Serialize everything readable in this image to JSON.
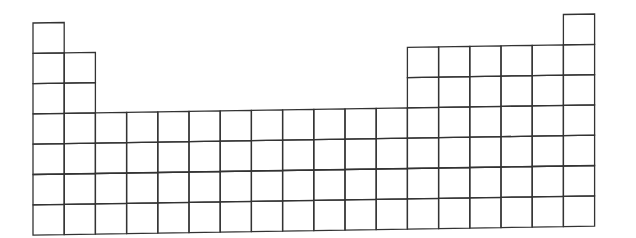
{
  "diagram": {
    "kind": "blank-periodic-table-outline",
    "columns": 18,
    "rows": 7,
    "line_color": "#333333",
    "background": "#ffffff",
    "grid": {
      "left_x": 33,
      "right_x": 595,
      "top_left_y": 23,
      "row_height": 30.3,
      "col_width": 31.2,
      "tilt_px_across": 9
    },
    "row_cells": [
      {
        "period": 1,
        "groups": [
          1,
          18
        ]
      },
      {
        "period": 2,
        "groups": [
          1,
          2,
          13,
          14,
          15,
          16,
          17,
          18
        ]
      },
      {
        "period": 3,
        "groups": [
          1,
          2,
          13,
          14,
          15,
          16,
          17,
          18
        ]
      },
      {
        "period": 4,
        "groups": [
          1,
          2,
          3,
          4,
          5,
          6,
          7,
          8,
          9,
          10,
          11,
          12,
          13,
          14,
          15,
          16,
          17,
          18
        ]
      },
      {
        "period": 5,
        "groups": [
          1,
          2,
          3,
          4,
          5,
          6,
          7,
          8,
          9,
          10,
          11,
          12,
          13,
          14,
          15,
          16,
          17,
          18
        ]
      },
      {
        "period": 6,
        "groups": [
          1,
          2,
          3,
          4,
          5,
          6,
          7,
          8,
          9,
          10,
          11,
          12,
          13,
          14,
          15,
          16,
          17,
          18
        ]
      },
      {
        "period": 7,
        "groups": [
          1,
          2,
          3,
          4,
          5,
          6,
          7,
          8,
          9,
          10,
          11,
          12,
          13,
          14,
          15,
          16,
          17,
          18
        ]
      }
    ]
  }
}
